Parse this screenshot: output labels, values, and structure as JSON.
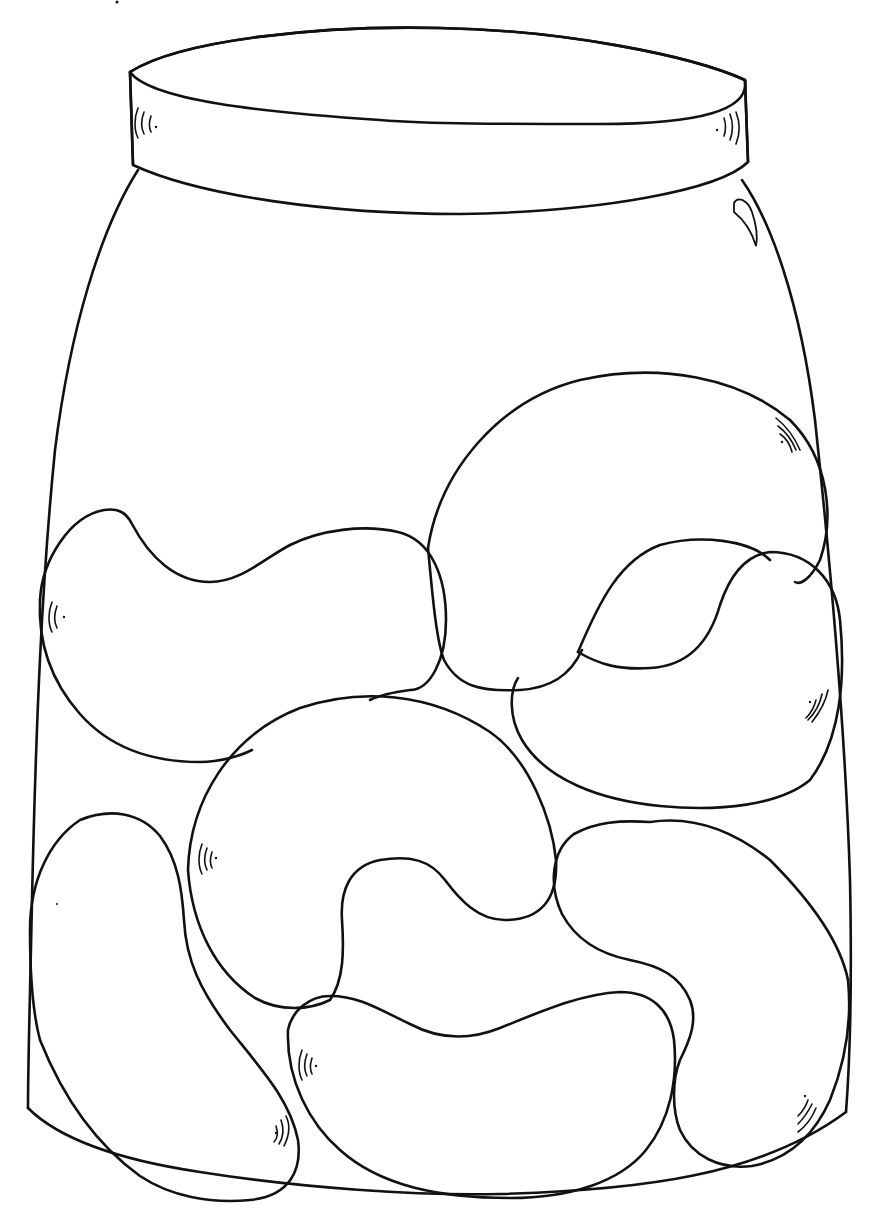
{
  "image": {
    "subject": "Jar of beans coloring page",
    "style": "black line art on white",
    "colors": {
      "line": "#111111",
      "background": "#ffffff"
    }
  },
  "drawing": {
    "jar": {
      "label": "jar",
      "parts": [
        "lid-top",
        "lid-band",
        "body",
        "highlight"
      ]
    },
    "beans": [
      {
        "id": 1,
        "label": "bean-left-middle"
      },
      {
        "id": 2,
        "label": "bean-top-right-large"
      },
      {
        "id": 3,
        "label": "bean-right-middle"
      },
      {
        "id": 4,
        "label": "bean-center-curled"
      },
      {
        "id": 5,
        "label": "bean-bottom-left"
      },
      {
        "id": 6,
        "label": "bean-bottom-center"
      },
      {
        "id": 7,
        "label": "bean-bottom-right"
      }
    ],
    "bean_count": 7
  }
}
